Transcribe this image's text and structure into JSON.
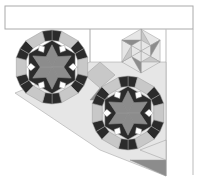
{
  "diagram": {
    "type": "quilt-pattern",
    "title_box": {
      "text": ""
    },
    "colors": {
      "dark": "#2b2b2b",
      "medium": "#8c8c8c",
      "light": "#c8c8c8",
      "pale": "#e6e6e6",
      "white": "#ffffff",
      "line": "#9a9a9a"
    },
    "blocks": [
      {
        "name": "star-hexagon-1",
        "cx": 52,
        "cy": 67,
        "r": 37
      },
      {
        "name": "star-hexagon-2",
        "cx": 128,
        "cy": 113,
        "r": 37
      },
      {
        "name": "small-star-hexagon",
        "cx": 141,
        "cy": 51,
        "r": 22
      }
    ]
  }
}
